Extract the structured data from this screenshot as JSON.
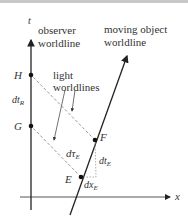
{
  "diagram": {
    "axes": {
      "t_label": "t",
      "x_label": "x"
    },
    "labels": {
      "observer_line1": "observer",
      "observer_line2": "worldline",
      "moving_line1": "moving object",
      "moving_line2": "worldline",
      "light_line1": "light",
      "light_line2": "worldlines"
    },
    "events": {
      "H": "H",
      "G": "G",
      "F": "F",
      "E": "E"
    },
    "intervals": {
      "dtR": "dt",
      "dtR_sub": "R",
      "dtauE": "dτ",
      "dtauE_sub": "E",
      "dtE": "dt",
      "dtE_sub": "E",
      "dxE": "dx",
      "dxE_sub": "E"
    },
    "colors": {
      "line": "#222222",
      "dashed": "#999999",
      "text": "#333333"
    }
  }
}
